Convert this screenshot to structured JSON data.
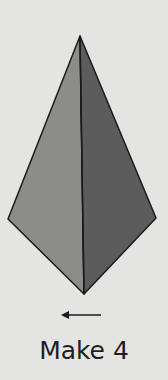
{
  "diagram": {
    "shape": "kite",
    "vertices": {
      "top": [
        80,
        36
      ],
      "left": [
        8,
        219
      ],
      "right": [
        156,
        218
      ],
      "bottom": [
        84,
        294
      ]
    },
    "colors": {
      "background": "#e4e4e2",
      "left_face": "#8c8c8b",
      "right_face": "#5c5c5c",
      "outline": "#1a1a1a"
    },
    "arrow": {
      "direction": "left",
      "from": [
        101,
        315
      ],
      "to": [
        61,
        315
      ]
    },
    "caption": "Make 4"
  }
}
